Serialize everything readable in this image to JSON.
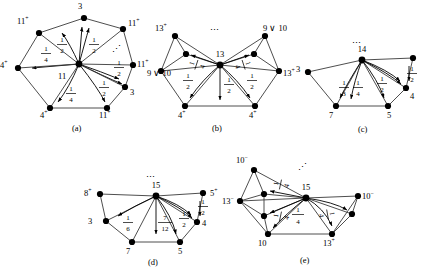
{
  "figure": {
    "panels": [
      {
        "id": "a",
        "caption": "(a)",
        "hub": "11",
        "vertices": [
          {
            "base": "3",
            "sup": ""
          },
          {
            "base": "11",
            "sup": "+"
          },
          {
            "base": "11",
            "sup": "+"
          },
          {
            "base": "11",
            "sup": "+"
          },
          {
            "base": "3",
            "sup": ""
          },
          {
            "base": "11",
            "sup": "+"
          },
          {
            "base": "4",
            "sup": "+"
          },
          {
            "base": "4",
            "sup": "+"
          }
        ],
        "fractions": [
          "1/2",
          "1/2",
          "1/4",
          "1/4",
          "1/2",
          "1/2"
        ],
        "ellipsis": "⋰"
      },
      {
        "id": "b",
        "caption": "(b)",
        "hub": "13",
        "vertices": [
          {
            "base": "13",
            "sup": "+"
          },
          {
            "base": "9 ∨ 10",
            "sup": ""
          },
          {
            "base": "9 ∨ 10",
            "sup": ""
          },
          {
            "base": "13",
            "sup": "+"
          },
          {
            "base": "4",
            "sup": "+"
          },
          {
            "base": "4",
            "sup": "+"
          }
        ],
        "fractions": [
          "1/4",
          "1/4",
          "1/2",
          "1/2",
          "1/2"
        ],
        "ellipsis": "⋯"
      },
      {
        "id": "c",
        "caption": "(c)",
        "hub": "14",
        "vertices": [
          {
            "base": "3",
            "sup": ""
          },
          {
            "base": "4",
            "sup": ""
          },
          {
            "base": "7",
            "sup": ""
          },
          {
            "base": "5",
            "sup": ""
          }
        ],
        "fractions": [
          "1/2",
          "1/3",
          "1/4",
          "1/2"
        ],
        "ellipsis": "⋯"
      },
      {
        "id": "d",
        "caption": "(d)",
        "hub": "15",
        "vertices": [
          {
            "base": "8",
            "sup": "+"
          },
          {
            "base": "5",
            "sup": "+"
          },
          {
            "base": "3",
            "sup": ""
          },
          {
            "base": "4",
            "sup": ""
          },
          {
            "base": "7",
            "sup": ""
          },
          {
            "base": "5",
            "sup": ""
          }
        ],
        "fractions": [
          "1/2",
          "1/6",
          "7/12",
          "1/2"
        ],
        "ellipsis": "⋯"
      },
      {
        "id": "e",
        "caption": "(e)",
        "hub": "15",
        "vertices": [
          {
            "base": "10",
            "sup": "−"
          },
          {
            "base": "13",
            "sup": "−"
          },
          {
            "base": "10",
            "sup": "−"
          },
          {
            "base": "10",
            "sup": ""
          },
          {
            "base": "13",
            "sup": "+"
          }
        ],
        "fractions": [
          "1/4",
          "1/4",
          "1/4",
          "1/4"
        ],
        "ellipsis": "⋰"
      }
    ]
  },
  "colors": {
    "node": "#000000",
    "edge": "#3a3a3a",
    "arrow": "#000000",
    "background": "#ffffff"
  }
}
